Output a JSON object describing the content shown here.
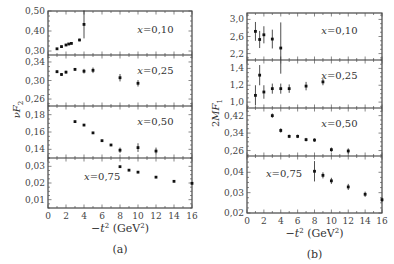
{
  "chart_data": [
    {
      "type": "scatter",
      "caption": "(a)",
      "ylabel": "νF2",
      "xlabel": "−t² (GeV²)",
      "x_ticks": [
        0,
        2,
        4,
        6,
        8,
        10,
        12,
        14,
        16
      ],
      "xlim": [
        0,
        16
      ],
      "frame": {
        "left": 48,
        "right": 192,
        "top": 11,
        "bottom": 208
      },
      "panels": [
        {
          "label": "x=0.10",
          "ylim": [
            0.28,
            0.5
          ],
          "yticks": [
            {
              "v": 0.3,
              "t": "0,30"
            },
            {
              "v": 0.4,
              "t": "0,40"
            },
            {
              "v": 0.5,
              "t": "0,50"
            }
          ],
          "top": 11,
          "bottom": 55,
          "label_pos": [
            0.62,
            0.32
          ],
          "points": [
            {
              "x": 1.0,
              "y": 0.311,
              "e": 0.004
            },
            {
              "x": 1.5,
              "y": 0.322,
              "e": 0.004
            },
            {
              "x": 2.0,
              "y": 0.33,
              "e": 0.004
            },
            {
              "x": 2.3,
              "y": 0.335,
              "e": 0.004
            },
            {
              "x": 2.6,
              "y": 0.338,
              "e": 0.004
            },
            {
              "x": 3.5,
              "y": 0.355,
              "e": 0.006
            },
            {
              "x": 4.0,
              "y": 0.433,
              "e": 0.07
            }
          ]
        },
        {
          "label": "x=0.25",
          "ylim": [
            0.245,
            0.355
          ],
          "yticks": [
            {
              "v": 0.26,
              "t": "0,26"
            },
            {
              "v": 0.3,
              "t": "0,30"
            },
            {
              "v": 0.34,
              "t": "0,34"
            }
          ],
          "top": 55,
          "bottom": 106,
          "label_pos": [
            0.62,
            0.22
          ],
          "points": [
            {
              "x": 1.0,
              "y": 0.319,
              "e": 0.003
            },
            {
              "x": 1.5,
              "y": 0.313,
              "e": 0.003
            },
            {
              "x": 2.0,
              "y": 0.318,
              "e": 0.003
            },
            {
              "x": 3.0,
              "y": 0.324,
              "e": 0.003
            },
            {
              "x": 4.0,
              "y": 0.32,
              "e": 0.005
            },
            {
              "x": 5.0,
              "y": 0.322,
              "e": 0.006
            },
            {
              "x": 8.0,
              "y": 0.306,
              "e": 0.008
            },
            {
              "x": 10.0,
              "y": 0.294,
              "e": 0.007
            }
          ]
        },
        {
          "label": "x=0.50",
          "ylim": [
            0.13,
            0.19
          ],
          "yticks": [
            {
              "v": 0.14,
              "t": "0,14"
            },
            {
              "v": 0.16,
              "t": "0,16"
            },
            {
              "v": 0.18,
              "t": "0,18"
            }
          ],
          "top": 106,
          "bottom": 158,
          "label_pos": [
            0.62,
            0.22
          ],
          "points": [
            {
              "x": 3,
              "y": 0.172,
              "e": 0.0
            },
            {
              "x": 4,
              "y": 0.168,
              "e": 0.0
            },
            {
              "x": 5,
              "y": 0.159,
              "e": 0.0
            },
            {
              "x": 6,
              "y": 0.15,
              "e": 0.0
            },
            {
              "x": 7,
              "y": 0.145,
              "e": 0.0
            },
            {
              "x": 8,
              "y": 0.139,
              "e": 0.003
            },
            {
              "x": 10,
              "y": 0.142,
              "e": 0.005
            },
            {
              "x": 12,
              "y": 0.138,
              "e": 0.004
            }
          ]
        },
        {
          "label": "x=0.75",
          "ylim": [
            0.005,
            0.035
          ],
          "yticks": [
            {
              "v": 0.01,
              "t": "0,01"
            },
            {
              "v": 0.02,
              "t": "0,02"
            },
            {
              "v": 0.03,
              "t": "0,03"
            }
          ],
          "top": 158,
          "bottom": 208,
          "label_pos": [
            0.25,
            0.28
          ],
          "points": [
            {
              "x": 8,
              "y": 0.0298,
              "e": 0.0
            },
            {
              "x": 9,
              "y": 0.0277,
              "e": 0.0
            },
            {
              "x": 10,
              "y": 0.0265,
              "e": 0.0
            },
            {
              "x": 12,
              "y": 0.0235,
              "e": 0.0
            },
            {
              "x": 14,
              "y": 0.021,
              "e": 0.0
            },
            {
              "x": 16,
              "y": 0.0198,
              "e": 0.0
            }
          ]
        }
      ]
    },
    {
      "type": "scatter",
      "caption": "(b)",
      "ylabel": "2MF1",
      "xlabel": "−t² (GeV²)",
      "x_ticks": [
        0,
        2,
        4,
        6,
        8,
        10,
        12,
        14,
        16
      ],
      "xlim": [
        0,
        16
      ],
      "frame": {
        "left": 247,
        "right": 382,
        "top": 13,
        "bottom": 213
      },
      "panels": [
        {
          "label": "x=0.10",
          "ylim": [
            2.05,
            3.15
          ],
          "yticks": [
            {
              "v": 2.2,
              "t": "2,2"
            },
            {
              "v": 2.6,
              "t": "2,6"
            },
            {
              "v": 3.0,
              "t": "3,0"
            }
          ],
          "top": 13,
          "bottom": 60,
          "label_pos": [
            0.55,
            0.28
          ],
          "points": [
            {
              "x": 1.0,
              "y": 2.72,
              "e": 0.22
            },
            {
              "x": 1.5,
              "y": 2.53,
              "e": 0.2
            },
            {
              "x": 2.0,
              "y": 2.64,
              "e": 0.2
            },
            {
              "x": 3.0,
              "y": 2.54,
              "e": 0.22
            },
            {
              "x": 4.0,
              "y": 2.33,
              "e": 0.6
            }
          ]
        },
        {
          "label": "x=0.25",
          "ylim": [
            0.93,
            1.5
          ],
          "yticks": [
            {
              "v": 1.0,
              "t": "1,0"
            },
            {
              "v": 1.2,
              "t": "1,2"
            },
            {
              "v": 1.4,
              "t": "1,4"
            }
          ],
          "top": 60,
          "bottom": 108,
          "label_pos": [
            0.55,
            0.22
          ],
          "points": [
            {
              "x": 1.0,
              "y": 1.08,
              "e": 0.12
            },
            {
              "x": 1.5,
              "y": 1.32,
              "e": 0.12
            },
            {
              "x": 2.0,
              "y": 1.12,
              "e": 0.08
            },
            {
              "x": 3.0,
              "y": 1.16,
              "e": 0.06
            },
            {
              "x": 4.0,
              "y": 1.16,
              "e": 0.06
            },
            {
              "x": 5.0,
              "y": 1.16,
              "e": 0.05
            },
            {
              "x": 7.0,
              "y": 1.19,
              "e": 0.05
            },
            {
              "x": 9.0,
              "y": 1.24,
              "e": 0.04
            }
          ]
        },
        {
          "label": "x=0.50",
          "ylim": [
            0.235,
            0.455
          ],
          "yticks": [
            {
              "v": 0.26,
              "t": "0,26"
            },
            {
              "v": 0.34,
              "t": "0,34"
            },
            {
              "v": 0.42,
              "t": "0,42"
            }
          ],
          "top": 108,
          "bottom": 156,
          "label_pos": [
            0.55,
            0.22
          ],
          "points": [
            {
              "x": 3,
              "y": 0.42,
              "e": 0.01
            },
            {
              "x": 4,
              "y": 0.352,
              "e": 0.01
            },
            {
              "x": 5,
              "y": 0.325,
              "e": 0.008
            },
            {
              "x": 6,
              "y": 0.325,
              "e": 0.008
            },
            {
              "x": 7,
              "y": 0.31,
              "e": 0.008
            },
            {
              "x": 8,
              "y": 0.308,
              "e": 0.008
            },
            {
              "x": 10,
              "y": 0.264,
              "e": 0.01
            },
            {
              "x": 12,
              "y": 0.258,
              "e": 0.012
            }
          ]
        },
        {
          "label": "x=0.75",
          "ylim": [
            0.02,
            0.048
          ],
          "yticks": [
            {
              "v": 0.02,
              "t": "0,02"
            },
            {
              "v": 0.03,
              "t": "0,03"
            },
            {
              "v": 0.04,
              "t": "0,04"
            }
          ],
          "top": 156,
          "bottom": 213,
          "label_pos": [
            0.14,
            0.22
          ],
          "points": [
            {
              "x": 8,
              "y": 0.0405,
              "e": 0.005
            },
            {
              "x": 9,
              "y": 0.0385,
              "e": 0.0015
            },
            {
              "x": 10,
              "y": 0.0358,
              "e": 0.0015
            },
            {
              "x": 12,
              "y": 0.0328,
              "e": 0.0015
            },
            {
              "x": 14,
              "y": 0.0292,
              "e": 0.0013
            },
            {
              "x": 16,
              "y": 0.0265,
              "e": 0.001
            }
          ]
        }
      ]
    }
  ]
}
